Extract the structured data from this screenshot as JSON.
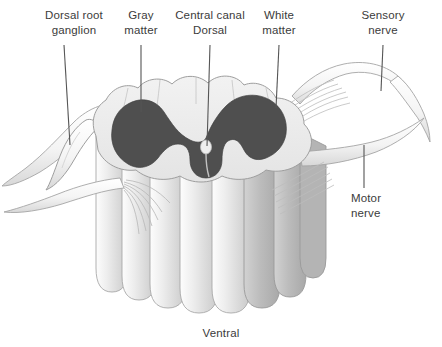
{
  "figure": {
    "background_color": "#ffffff"
  },
  "colors": {
    "gray_matter": "#4f4f4f",
    "white_matter": "#e9e9e9",
    "column_shade": "#bcbcbc",
    "outline": "#9a9a9a",
    "leader_line": "#555555",
    "text": "#3b3b3b"
  },
  "labels": [
    {
      "id": "dorsal-root-ganglion",
      "text": "Dorsal root\nganglion",
      "x": 28,
      "y": 8,
      "width": 92,
      "align": "center"
    },
    {
      "id": "gray-matter",
      "text": "Gray\nmatter",
      "x": 113,
      "y": 8,
      "width": 56,
      "align": "center"
    },
    {
      "id": "central-canal-dorsal",
      "text": "Central canal\nDorsal",
      "x": 166,
      "y": 8,
      "width": 88,
      "align": "center"
    },
    {
      "id": "white-matter",
      "text": "White\nmatter",
      "x": 251,
      "y": 8,
      "width": 56,
      "align": "center"
    },
    {
      "id": "sensory-nerve",
      "text": "Sensory\nnerve",
      "x": 352,
      "y": 8,
      "width": 62,
      "align": "center"
    },
    {
      "id": "motor-nerve",
      "text": "Motor\nnerve",
      "x": 351,
      "y": 191,
      "width": 56,
      "align": "left"
    },
    {
      "id": "ventral",
      "text": "Ventral",
      "x": 190,
      "y": 326,
      "width": 62,
      "align": "center"
    }
  ],
  "leader_lines": [
    {
      "id": "leader-dorsal-root-ganglion",
      "x1": 64,
      "y1": 45,
      "x2": 70,
      "y2": 145
    },
    {
      "id": "leader-gray-matter",
      "x1": 141,
      "y1": 45,
      "x2": 141,
      "y2": 112
    },
    {
      "id": "leader-central-canal",
      "x1": 210,
      "y1": 45,
      "x2": 207,
      "y2": 146
    },
    {
      "id": "leader-white-matter",
      "x1": 279,
      "y1": 45,
      "x2": 276,
      "y2": 108
    },
    {
      "id": "leader-sensory-nerve",
      "x1": 383,
      "y1": 45,
      "x2": 381,
      "y2": 91
    },
    {
      "id": "leader-motor-nerve",
      "x1": 364,
      "y1": 145,
      "x2": 364,
      "y2": 188
    }
  ],
  "anatomy": {
    "structures": [
      "dorsal root ganglion",
      "dorsal root",
      "ventral root",
      "gray matter",
      "white matter",
      "central canal",
      "sensory nerve",
      "motor nerve",
      "spinal cord columns"
    ],
    "orientation": {
      "top": "Dorsal",
      "bottom": "Ventral"
    }
  }
}
